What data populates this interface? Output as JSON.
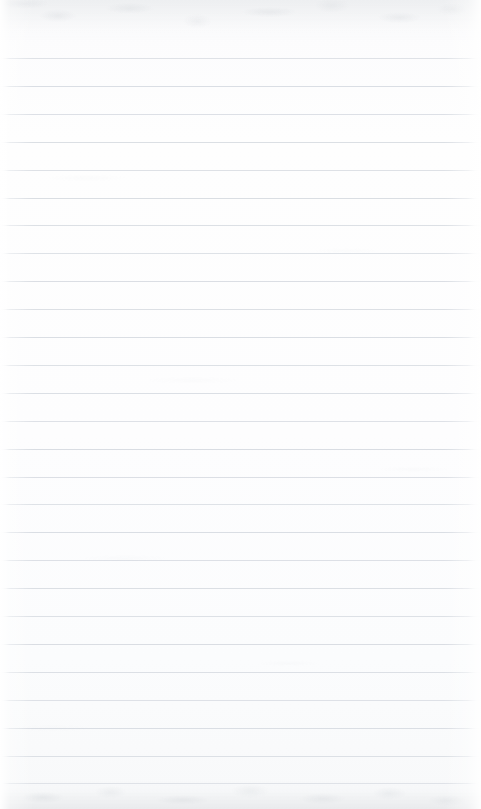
{
  "document": {
    "kind": "lined-notebook-paper-scan",
    "title": "Blank Ruled Notebook Page",
    "page_width": 481,
    "page_height": 809,
    "orientation": "portrait",
    "content_text": "",
    "is_blank": true,
    "has_margin_rule": false,
    "has_handwriting": false,
    "has_printed_text": false
  },
  "paper": {
    "background_color": "#fdfdfe",
    "top_shade_color": "#f7f8f9",
    "bottom_shade_color": "#f4f5f6",
    "edge_highlight_color": "#ffffff"
  },
  "ruling": {
    "line_color": "#d9dde3",
    "line_color_faint": "#e4e8ed",
    "line_thickness": 1,
    "line_spacing": 27.9,
    "first_line_y": 58,
    "last_line_y": 783,
    "line_count": 27,
    "line_left_x": 0,
    "line_right_x": 481,
    "lines_y": [
      58,
      85.9,
      113.8,
      141.7,
      169.6,
      197.5,
      225.4,
      253.3,
      281.2,
      309.1,
      337,
      364.9,
      392.8,
      420.7,
      448.6,
      476.5,
      504.4,
      532.3,
      560.2,
      588.1,
      616,
      643.9,
      671.8,
      699.7,
      727.6,
      755.5,
      783.4
    ],
    "line_opacities": [
      0.82,
      0.95,
      0.88,
      0.93,
      0.86,
      0.97,
      0.9,
      0.84,
      0.94,
      0.89,
      0.96,
      0.87,
      0.92,
      0.85,
      0.98,
      0.91,
      0.83,
      0.95,
      0.88,
      0.93,
      0.86,
      0.97,
      0.9,
      0.84,
      0.94,
      0.89,
      0.8
    ]
  },
  "margins": {
    "top_margin_height": 58,
    "bottom_margin_height": 25
  },
  "texture": {
    "top_band_height": 46,
    "bottom_band_height": 30,
    "mottle_color": "#b0b5bc"
  }
}
